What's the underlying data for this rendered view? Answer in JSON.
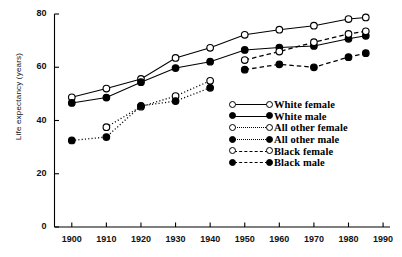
{
  "chart_data": {
    "type": "line",
    "title": "",
    "xlabel": "",
    "ylabel": "Life expectancy (years)",
    "xlim": [
      1895,
      1992
    ],
    "ylim": [
      0,
      80
    ],
    "xticks": [
      1900,
      1910,
      1920,
      1930,
      1940,
      1950,
      1960,
      1970,
      1980,
      1990
    ],
    "yticks": [
      0,
      20,
      40,
      60,
      80
    ],
    "grid": false,
    "legend_position": "center-right",
    "series": [
      {
        "name": "White female",
        "marker": "open-circle",
        "linestyle": "solid",
        "x": [
          1900,
          1910,
          1920,
          1930,
          1940,
          1950,
          1960,
          1970,
          1980,
          1985
        ],
        "y": [
          48.7,
          52.0,
          55.6,
          63.5,
          67.3,
          72.2,
          74.1,
          75.6,
          78.1,
          78.7
        ]
      },
      {
        "name": "White male",
        "marker": "filled-circle",
        "linestyle": "solid",
        "x": [
          1900,
          1910,
          1920,
          1930,
          1940,
          1950,
          1960,
          1970,
          1980,
          1985
        ],
        "y": [
          46.6,
          48.6,
          54.4,
          59.7,
          62.1,
          66.5,
          67.4,
          68.0,
          70.7,
          71.8
        ]
      },
      {
        "name": "All other female",
        "marker": "open-circle",
        "linestyle": "dotted",
        "x": [
          1910,
          1920,
          1930,
          1940
        ],
        "y": [
          37.5,
          45.2,
          49.2,
          54.9
        ]
      },
      {
        "name": "All other male",
        "marker": "filled-circle",
        "linestyle": "dotted",
        "x": [
          1900,
          1910,
          1920,
          1930,
          1940
        ],
        "y": [
          32.5,
          33.8,
          45.5,
          47.3,
          52.3
        ]
      },
      {
        "name": "Black female",
        "marker": "open-circle",
        "linestyle": "dashed",
        "x": [
          1950,
          1960,
          1970,
          1980,
          1985
        ],
        "y": [
          62.7,
          65.9,
          69.4,
          72.5,
          73.5
        ]
      },
      {
        "name": "Black male",
        "marker": "filled-circle",
        "linestyle": "dashed",
        "x": [
          1950,
          1960,
          1970,
          1980,
          1985
        ],
        "y": [
          59.1,
          61.1,
          60.0,
          63.8,
          65.3
        ]
      }
    ],
    "legend": [
      {
        "label": "White female",
        "marker": "open-circle",
        "linestyle": "solid"
      },
      {
        "label": "White male",
        "marker": "filled-circle",
        "linestyle": "solid"
      },
      {
        "label": "All other female",
        "marker": "open-circle",
        "linestyle": "dotted"
      },
      {
        "label": "All other male",
        "marker": "filled-circle",
        "linestyle": "dotted"
      },
      {
        "label": "Black female",
        "marker": "open-circle",
        "linestyle": "dashed"
      },
      {
        "label": "Black male",
        "marker": "filled-circle",
        "linestyle": "dashed"
      }
    ]
  }
}
